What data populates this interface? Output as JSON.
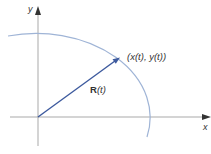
{
  "diagram": {
    "type": "parametric-curve-position-vector",
    "axes": {
      "x_label": "x",
      "y_label": "y"
    },
    "curve": {
      "description": "elliptical arc in first quadrant",
      "color": "#9fb4d6"
    },
    "vector": {
      "label_symbol": "R",
      "label_arg": "(t)",
      "label_full": "R(t)",
      "color": "#3d5a9e"
    },
    "point": {
      "label": "(x(t), y(t))"
    },
    "colors": {
      "axes": "#a9a9a9",
      "curve": "#9fb4d6",
      "vector": "#3d5a9e",
      "text": "#333333",
      "background": "#ffffff"
    }
  }
}
